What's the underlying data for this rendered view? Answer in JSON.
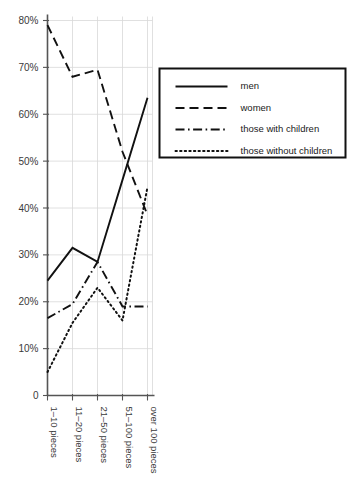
{
  "chart_data": {
    "type": "line",
    "title": "",
    "subtitle": "",
    "xlabel": "",
    "ylabel": "",
    "categories": [
      "1–10 pieces",
      "11–20 pieces",
      "21–50 pieces",
      "51–100 pieces",
      "over 100 pieces"
    ],
    "ylim": [
      0,
      80
    ],
    "ytick_labels": [
      "0",
      "10%",
      "20%",
      "30%",
      "40%",
      "50%",
      "60%",
      "70%",
      "80%"
    ],
    "ytick_values": [
      0,
      10,
      20,
      30,
      40,
      50,
      60,
      70,
      80
    ],
    "grid": true,
    "legend_position": "upper right",
    "series": [
      {
        "name": "men",
        "style": "solid",
        "color": "#111111",
        "values": [
          24.5,
          31.5,
          28.5,
          46.0,
          63.5
        ]
      },
      {
        "name": "women",
        "style": "dashed",
        "color": "#111111",
        "values": [
          79.0,
          68.0,
          69.5,
          52.0,
          38.5
        ]
      },
      {
        "name": "those with children",
        "style": "dashdot",
        "color": "#111111",
        "values": [
          16.5,
          19.5,
          28.5,
          19.0,
          19.0
        ]
      },
      {
        "name": "those without children",
        "style": "dotted",
        "color": "#111111",
        "values": [
          5.0,
          15.5,
          23.0,
          16.0,
          44.5
        ]
      }
    ]
  },
  "legend": {
    "items": [
      {
        "label": "men"
      },
      {
        "label": "women"
      },
      {
        "label": "those with children"
      },
      {
        "label": "those without children"
      }
    ]
  }
}
